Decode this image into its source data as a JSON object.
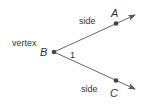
{
  "diagram": {
    "type": "angle",
    "labels": {
      "vertex_text": "vertex",
      "side_top": "side",
      "side_bottom": "side",
      "angle_number": "1",
      "point_vertex": "B",
      "point_top": "A",
      "point_bottom": "C"
    },
    "points": {
      "B": [
        54,
        52
      ],
      "A": [
        116,
        23
      ],
      "C": [
        116,
        81
      ]
    },
    "rays": [
      {
        "from": "B",
        "through": "A",
        "end": [
          135,
          15
        ]
      },
      {
        "from": "B",
        "through": "C",
        "end": [
          135,
          89
        ]
      }
    ],
    "colors": {
      "line": "#555555",
      "text": "#333333",
      "point": "#444444"
    }
  }
}
